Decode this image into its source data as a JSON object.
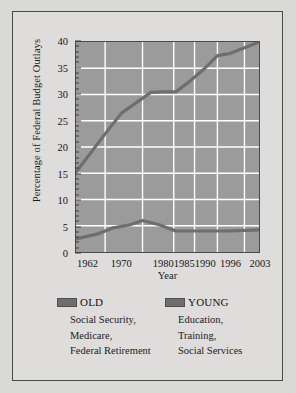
{
  "chart_data": {
    "type": "line",
    "title": "",
    "xlabel": "Year",
    "ylabel": "Percentage of Federal Budget Outlays",
    "xlim": [
      1959,
      2003
    ],
    "ylim": [
      0,
      40
    ],
    "ytick_labels": [
      "0",
      "5",
      "10",
      "15",
      "20",
      "25",
      "30",
      "35",
      "40"
    ],
    "ytick_values": [
      0,
      5,
      10,
      15,
      20,
      25,
      30,
      35,
      40
    ],
    "xtick_labels": [
      "1962",
      "1970",
      "1980",
      "1985",
      "1990",
      "1996",
      "2003"
    ],
    "xtick_values": [
      1962,
      1970,
      1980,
      1985,
      1990,
      1996,
      2003
    ],
    "grid": true,
    "legend_position": "below",
    "series": [
      {
        "name": "OLD",
        "color": "#6e6e6e",
        "x": [
          1959,
          1966,
          1970,
          1977,
          1980,
          1983,
          1986,
          1990,
          1993,
          1996,
          2003
        ],
        "values": [
          15.2,
          22.5,
          26.5,
          30.4,
          30.5,
          30.5,
          32.3,
          35.0,
          37.4,
          37.8,
          40.0
        ]
      },
      {
        "name": "YOUNG",
        "color": "#6e6e6e",
        "x": [
          1959,
          1964,
          1968,
          1972,
          1975,
          1979,
          1983,
          1986,
          1990,
          1996,
          2003
        ],
        "values": [
          2.5,
          3.4,
          4.6,
          5.2,
          6.0,
          5.2,
          4.0,
          4.0,
          4.0,
          4.0,
          4.2
        ]
      }
    ]
  },
  "legend": {
    "old": {
      "title": "OLD",
      "lines": [
        "Social Security,",
        "Medicare,",
        "Federal Retirement"
      ]
    },
    "young": {
      "title": "YOUNG",
      "lines": [
        "Education,",
        "Training,",
        "Social Services"
      ]
    }
  }
}
